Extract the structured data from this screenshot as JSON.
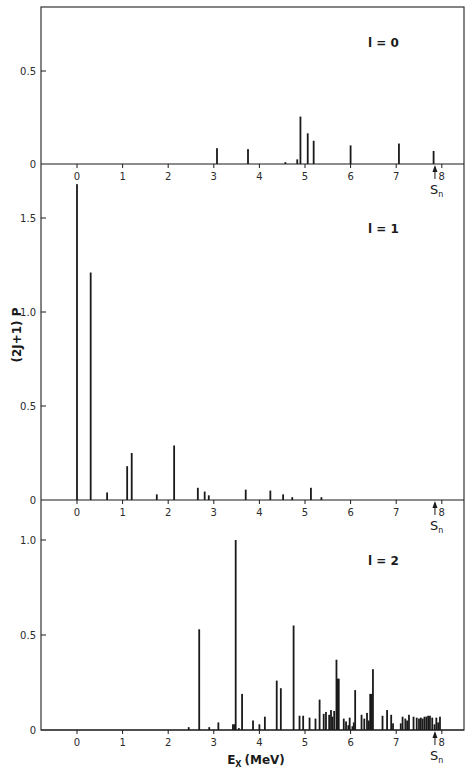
{
  "chart_data": [
    {
      "type": "bar",
      "title": "l = 0",
      "panel_label": "l = 0",
      "xlabel": "E_X (MeV)",
      "ylabel": "(2J+1) P",
      "xlim": [
        -0.8,
        8.5
      ],
      "ylim": [
        0,
        0.84
      ],
      "yticks": [
        0,
        0.5
      ],
      "ytick_labels": [
        "0",
        "0.5"
      ],
      "xticks": [
        0,
        1,
        2,
        3,
        4,
        5,
        6,
        7,
        8
      ],
      "xtick_labels": [
        "0",
        "1",
        "2",
        "3",
        "4",
        "5",
        "6",
        "7",
        "8"
      ],
      "grid": false,
      "sn_marker": {
        "x": 7.85,
        "label": "S",
        "sub": "n"
      },
      "x": [
        3.07,
        3.75,
        4.57,
        4.83,
        4.9,
        5.06,
        5.19,
        6.0,
        7.06,
        7.82
      ],
      "values": [
        0.085,
        0.08,
        0.01,
        0.025,
        0.255,
        0.165,
        0.125,
        0.1,
        0.11,
        0.07
      ]
    },
    {
      "type": "bar",
      "title": "l = 1",
      "panel_label": "l = 1",
      "xlabel": "E_X (MeV)",
      "ylabel": "(2J+1) P",
      "xlim": [
        -0.8,
        8.5
      ],
      "ylim": [
        0,
        1.79
      ],
      "yticks": [
        0,
        0.5,
        1.0,
        1.5
      ],
      "ytick_labels": [
        "0",
        "0.5",
        "1.0",
        "1.5"
      ],
      "xticks": [
        0,
        1,
        2,
        3,
        4,
        5,
        6,
        7,
        8
      ],
      "xtick_labels": [
        "0",
        "1",
        "2",
        "3",
        "4",
        "5",
        "6",
        "7",
        "8"
      ],
      "grid": false,
      "sn_marker": {
        "x": 7.85,
        "label": "S",
        "sub": "n"
      },
      "x": [
        0.0,
        0.3,
        0.66,
        1.1,
        1.2,
        1.75,
        2.13,
        2.65,
        2.8,
        2.89,
        3.7,
        4.24,
        4.52,
        4.72,
        5.13,
        5.36
      ],
      "values": [
        1.68,
        1.21,
        0.04,
        0.18,
        0.25,
        0.03,
        0.29,
        0.065,
        0.045,
        0.025,
        0.055,
        0.05,
        0.03,
        0.015,
        0.065,
        0.015
      ]
    },
    {
      "type": "bar",
      "title": "l = 2",
      "panel_label": "l = 2",
      "xlabel": "E_X (MeV)",
      "ylabel": "(2J+1) P",
      "xlim": [
        -0.8,
        8.5
      ],
      "ylim": [
        0,
        1.21
      ],
      "yticks": [
        0,
        0.5,
        1.0
      ],
      "ytick_labels": [
        "0",
        "0.5",
        "1.0"
      ],
      "xticks": [
        0,
        1,
        2,
        3,
        4,
        5,
        6,
        7,
        8
      ],
      "xtick_labels": [
        "0",
        "1",
        "2",
        "3",
        "4",
        "5",
        "6",
        "7",
        "8"
      ],
      "grid": false,
      "sn_marker": {
        "x": 7.85,
        "label": "S",
        "sub": "n"
      },
      "x": [
        2.45,
        2.68,
        2.9,
        3.1,
        3.42,
        3.45,
        3.48,
        3.55,
        3.62,
        3.86,
        4.0,
        4.12,
        4.38,
        4.47,
        4.75,
        4.88,
        4.96,
        5.1,
        5.23,
        5.32,
        5.41,
        5.46,
        5.53,
        5.57,
        5.6,
        5.64,
        5.69,
        5.72,
        5.74,
        5.85,
        5.9,
        5.95,
        5.98,
        6.04,
        6.07,
        6.1,
        6.24,
        6.3,
        6.36,
        6.4,
        6.43,
        6.46,
        6.49,
        6.7,
        6.8,
        6.89,
        6.93,
        7.1,
        7.14,
        7.2,
        7.24,
        7.28,
        7.38,
        7.45,
        7.5,
        7.54,
        7.58,
        7.62,
        7.66,
        7.7,
        7.74,
        7.79,
        7.84,
        7.88,
        7.92,
        7.96
      ],
      "values": [
        0.015,
        0.53,
        0.015,
        0.04,
        0.03,
        0.03,
        1.0,
        0.01,
        0.19,
        0.05,
        0.03,
        0.07,
        0.26,
        0.22,
        0.55,
        0.075,
        0.075,
        0.065,
        0.06,
        0.16,
        0.085,
        0.095,
        0.08,
        0.105,
        0.07,
        0.1,
        0.37,
        0.27,
        0.27,
        0.06,
        0.045,
        0.025,
        0.065,
        0.02,
        0.04,
        0.21,
        0.08,
        0.06,
        0.09,
        0.05,
        0.19,
        0.19,
        0.32,
        0.075,
        0.105,
        0.08,
        0.035,
        0.035,
        0.07,
        0.06,
        0.05,
        0.08,
        0.07,
        0.065,
        0.06,
        0.065,
        0.06,
        0.07,
        0.07,
        0.075,
        0.075,
        0.065,
        0.03,
        0.065,
        0.04,
        0.07
      ]
    }
  ],
  "figure": {
    "ylabel": "(2J+1) P",
    "xlabel_main": "E",
    "xlabel_sub": "X",
    "xlabel_unit": "(MeV)",
    "sn_label": "S",
    "sn_sub": "n",
    "panel_labels": [
      "l = 0",
      "l = 1",
      "l = 2"
    ]
  },
  "layout": {
    "frame": {
      "left": 41,
      "right": 464,
      "top": 7,
      "bottom": 730
    },
    "x_zero_px": 77,
    "px_per_mev": 45.6,
    "panels": [
      {
        "top": 7,
        "baseline": 164,
        "px_per_unit": 186,
        "label_x": 368,
        "label_y": 47
      },
      {
        "top": 164,
        "baseline": 500,
        "px_per_unit": 188,
        "label_x": 368,
        "label_y": 233
      },
      {
        "top": 500,
        "baseline": 730,
        "px_per_unit": 190,
        "label_x": 368,
        "label_y": 565
      }
    ],
    "colors": {
      "ink": "#1a1a1a",
      "frame": "#333333",
      "background": "#ffffff"
    }
  }
}
